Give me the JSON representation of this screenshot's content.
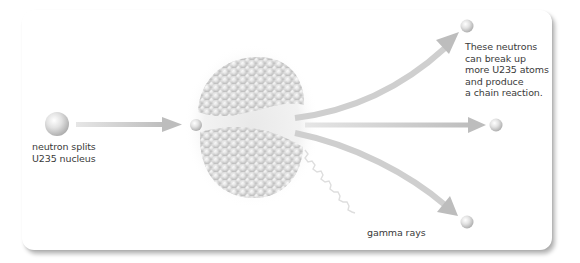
{
  "diagram": {
    "labels": {
      "incoming_neutron": "neutron splits\nU235 nucleus",
      "released_neutrons": "These neutrons\ncan break up\nmore U235 atoms\nand produce\na chain reaction.",
      "gamma": "gamma rays"
    },
    "nodes": [
      {
        "id": "incoming-neutron",
        "type": "neutron"
      },
      {
        "id": "absorbed-neutron",
        "type": "neutron"
      },
      {
        "id": "u235-nucleus",
        "type": "nucleus",
        "state": "splitting into two fragments"
      },
      {
        "id": "released-neutron-top",
        "type": "neutron"
      },
      {
        "id": "released-neutron-middle",
        "type": "neutron"
      },
      {
        "id": "released-neutron-bottom",
        "type": "neutron"
      }
    ],
    "edges": [
      {
        "from": "incoming-neutron",
        "to": "u235-nucleus",
        "style": "straight arrow"
      },
      {
        "from": "u235-nucleus",
        "to": "released-neutron-top",
        "style": "curved arrow"
      },
      {
        "from": "u235-nucleus",
        "to": "released-neutron-middle",
        "style": "straight arrow"
      },
      {
        "from": "u235-nucleus",
        "to": "released-neutron-bottom",
        "style": "curved arrow"
      },
      {
        "from": "u235-nucleus",
        "to": "gamma",
        "style": "wavy line"
      }
    ],
    "colors": {
      "arrow": "#c8c8c8",
      "sphere_light": "#f4f4f4",
      "sphere_dark": "#b8b8b8",
      "text": "#3a3a3a",
      "background": "#ffffff"
    }
  }
}
